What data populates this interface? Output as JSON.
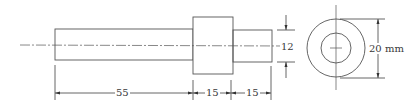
{
  "drawing": {
    "type": "stepped shaft orthographic drawing",
    "views": [
      "front-view",
      "end-view"
    ],
    "line_color": "#555555",
    "dimensions": {
      "left_shaft_length": "55",
      "collar_length": "15",
      "right_shaft_length": "15",
      "small_diameter": "12",
      "large_diameter": "20 mm"
    }
  }
}
